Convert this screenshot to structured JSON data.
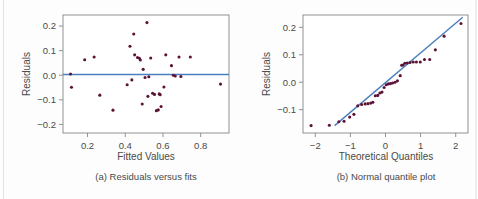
{
  "figure": {
    "background_color": "#fdfdfd",
    "point_color": "#5c1336",
    "line_color": "#4a7fbd",
    "frame_color": "#8e9193",
    "text_color": "#4a4a4a"
  },
  "chart_data": [
    {
      "type": "scatter",
      "panel": "a",
      "title": "",
      "caption": "(a) Residuals versus fits",
      "xlabel": "Fitted Values",
      "ylabel": "Residuals",
      "xlim": [
        0.07,
        0.95
      ],
      "ylim": [
        -0.235,
        0.245
      ],
      "xticks": [
        0.2,
        0.4,
        0.6,
        0.8
      ],
      "xticklabels": [
        "0.2",
        "0.4",
        "0.6",
        "0.8"
      ],
      "yticks": [
        0.2,
        0.1,
        0.0,
        -0.1,
        -0.2
      ],
      "yticklabels": [
        "0.2",
        "0.1",
        "0.0",
        "-0.1",
        "-0.2"
      ],
      "grid": false,
      "legend": "none",
      "reference_line": {
        "type": "horizontal",
        "y": 0.003,
        "label": "zero residual line",
        "color": "#4a7fbd"
      },
      "x": [
        0.11,
        0.115,
        0.185,
        0.235,
        0.265,
        0.335,
        0.41,
        0.425,
        0.435,
        0.445,
        0.45,
        0.465,
        0.475,
        0.48,
        0.49,
        0.495,
        0.505,
        0.515,
        0.52,
        0.525,
        0.535,
        0.545,
        0.555,
        0.565,
        0.575,
        0.58,
        0.585,
        0.59,
        0.605,
        0.615,
        0.645,
        0.655,
        0.665,
        0.685,
        0.695,
        0.745,
        0.905
      ],
      "y": [
        0.005,
        -0.049,
        0.063,
        0.074,
        -0.081,
        -0.142,
        -0.039,
        0.118,
        -0.019,
        0.168,
        0.083,
        0.072,
        0.069,
        0.062,
        -0.117,
        0.024,
        -0.009,
        0.214,
        -0.086,
        -0.006,
        0.07,
        -0.073,
        -0.078,
        -0.144,
        -0.141,
        -0.076,
        -0.079,
        -0.127,
        -0.048,
        0.083,
        0.039,
        0.0,
        -0.003,
        0.074,
        -0.005,
        0.074,
        -0.036
      ]
    },
    {
      "type": "scatter",
      "panel": "b",
      "title": "",
      "caption": "(b) Normal quantile plot",
      "xlabel": "Theoretical Quantiles",
      "ylabel": "Residuals",
      "xlim": [
        -2.35,
        2.35
      ],
      "ylim": [
        -0.185,
        0.245
      ],
      "xticks": [
        -2,
        -1,
        0,
        1,
        2
      ],
      "xticklabels": [
        "-2",
        "-1",
        "0",
        "1",
        "2"
      ],
      "yticks": [
        0.2,
        0.1,
        0.0,
        -0.1
      ],
      "yticklabels": [
        "0.2",
        "0.1",
        "0.0",
        "-0.1"
      ],
      "grid": false,
      "legend": "none",
      "reference_line": {
        "type": "qq-line",
        "x0": -1.45,
        "y0": -0.158,
        "x1": 2.2,
        "y1": 0.237,
        "label": "normal reference line",
        "color": "#4a7fbd"
      },
      "x": [
        -2.12,
        -1.6,
        -1.33,
        -1.18,
        -1.02,
        -0.9,
        -0.79,
        -0.68,
        -0.58,
        -0.5,
        -0.42,
        -0.36,
        -0.29,
        -0.22,
        -0.16,
        -0.1,
        -0.04,
        0.02,
        0.08,
        0.14,
        0.2,
        0.27,
        0.34,
        0.42,
        0.46,
        0.5,
        0.55,
        0.62,
        0.7,
        0.79,
        0.88,
        0.99,
        1.11,
        1.26,
        1.42,
        1.67,
        2.15
      ],
      "y": [
        -0.158,
        -0.157,
        -0.144,
        -0.142,
        -0.127,
        -0.117,
        -0.086,
        -0.081,
        -0.079,
        -0.078,
        -0.076,
        -0.073,
        -0.049,
        -0.048,
        -0.039,
        -0.036,
        -0.019,
        -0.009,
        -0.006,
        -0.005,
        -0.003,
        0.0,
        0.005,
        0.024,
        0.062,
        0.063,
        0.069,
        0.07,
        0.072,
        0.074,
        0.074,
        0.074,
        0.083,
        0.083,
        0.118,
        0.168,
        0.214
      ]
    }
  ]
}
